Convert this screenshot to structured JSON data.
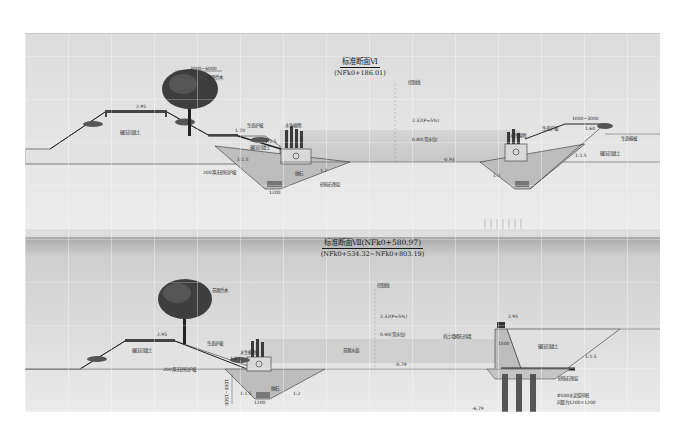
{
  "section1": {
    "title": "标准断面Ⅵ",
    "subtitle": "(NFk0+186.01)",
    "labels": {
      "width_left": "3000~6000",
      "tree": "景观乔木",
      "crest_elev_left": "2.95",
      "backfill_left": "碾压回填土",
      "slope_plant": "生态护坡",
      "aquatic_plant": "水生植物",
      "step_elev": "1.70",
      "backfill_low": "碾压回填土",
      "slope_ratio_1": "1:2.5",
      "slope_ratio_2": "1:1.5",
      "slope_ratio_3": "1:2",
      "riprap": "200厚无砂砼护坡",
      "stone": "抛石",
      "gravel": "砂砾石垫层",
      "bottom_width": "1200",
      "control_line": "控制线",
      "elev_design": "2.32(P=5%)",
      "elev_normal": "0.80(常水位)",
      "elev_bottom": "-0.93",
      "width_right": "1000~3000",
      "crest_elev_right": "1.60",
      "right_plant": "水生植物",
      "right_slope_plant": "生态护坡",
      "right_shrub": "生态植被",
      "backfill_right": "碾压回填土",
      "right_slope_ratio": "1:1.5",
      "right_slope_ratio_2": "1:2"
    }
  },
  "section2": {
    "title": "标准断面Ⅶ(NFk0+580.97)",
    "subtitle": "(NFk0+534.32~NFk0+803.19)",
    "labels": {
      "tree": "景观乔木",
      "crest_elev": "2.95",
      "backfill_left": "碾压回填土",
      "slope_plant": "生态护坡",
      "aquatic_plant": "水生植物",
      "slope_ratio": "1:2.5",
      "riprap": "200厚无砂砼护坡",
      "stone": "抛石",
      "bottom_width": "1200",
      "bank_height": "1000~1500",
      "slope_ratio_2": "1:1.5",
      "slope_ratio_3": "1:2",
      "control_line": "控制线",
      "elev_design": "2.32(P=5%)",
      "elev_normal": "0.40(常水位)",
      "water_area": "景观水面",
      "elev_bottom": "-0.79",
      "retaining_wall": "挡土墙砌石挡墙",
      "wall_width": "1500",
      "wall_crest": "2.95",
      "backfill_right": "碾压回填土",
      "right_slope_ratio": "1:1.5",
      "gravel": "砂砾石垫层",
      "piles": "Φ500水泥搅拌桩",
      "pile_spacing": "间距为1200×1200",
      "pile_bottom": "-6.79"
    }
  }
}
